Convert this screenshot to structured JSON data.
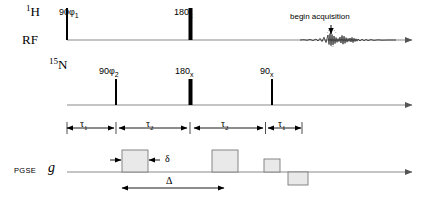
{
  "figure": {
    "type": "nmr-pulse-sequence-diagram",
    "width": 426,
    "height": 203,
    "background": "#ffffff",
    "line_color": "#808080",
    "pulse_color": "#000000",
    "gradient_fill": "#e8e8e8",
    "gradient_stroke": "#808080"
  },
  "channels": {
    "proton": {
      "label_html": "1H",
      "label": "¹H",
      "nucleus": "H",
      "mass": "1"
    },
    "rf": {
      "label": "RF"
    },
    "nitrogen": {
      "label_html": "15N",
      "label": "¹⁵N",
      "nucleus": "N",
      "mass": "15"
    },
    "pgse": {
      "label": "PGSE",
      "gradient_symbol": "g"
    }
  },
  "proton_pulses": [
    {
      "name": "excitation",
      "label": "90",
      "phase": "φ1",
      "phase_sub": "1",
      "flip_angle": 90,
      "x": 67,
      "width": 2,
      "height": 32
    },
    {
      "name": "refocusing",
      "label": "180",
      "phase": "x",
      "flip_angle": 180,
      "x": 190,
      "width": 4,
      "height": 32
    }
  ],
  "nitrogen_pulses": [
    {
      "name": "n-excitation",
      "label": "90",
      "phase": "φ2",
      "phase_sub": "2",
      "flip_angle": 90,
      "x": 116,
      "width": 2,
      "height": 26
    },
    {
      "name": "n-refocusing",
      "label": "180",
      "phase": "x",
      "flip_angle": 180,
      "x": 190,
      "width": 4,
      "height": 26
    },
    {
      "name": "n-readout",
      "label": "90",
      "phase": "x",
      "flip_angle": 90,
      "x": 272,
      "width": 2,
      "height": 26
    }
  ],
  "acquisition": {
    "label": "begin acquisition",
    "arrow": "down-arrow",
    "signal": "fid-waveform",
    "x": 328
  },
  "timings": [
    {
      "name": "tau-1-left",
      "symbol": "τ",
      "sub": "1",
      "x1": 67,
      "x2": 116
    },
    {
      "name": "tau-2-left",
      "symbol": "τ",
      "sub": "2",
      "x1": 119,
      "x2": 190
    },
    {
      "name": "tau-2-right",
      "symbol": "τ",
      "sub": "2",
      "x1": 193,
      "x2": 265
    },
    {
      "name": "tau-1-right",
      "symbol": "τ",
      "sub": "1",
      "x1": 268,
      "x2": 300
    }
  ],
  "gradient_pulses": [
    {
      "name": "gradient-1",
      "x": 122,
      "width": 26,
      "height": 22,
      "polarity": "positive"
    },
    {
      "name": "gradient-2",
      "x": 212,
      "width": 26,
      "height": 22,
      "polarity": "positive"
    },
    {
      "name": "gradient-3",
      "x": 264,
      "width": 16,
      "height": 13,
      "polarity": "positive"
    },
    {
      "name": "gradient-4",
      "x": 288,
      "width": 20,
      "height": 13,
      "polarity": "negative"
    }
  ],
  "gradient_annotations": [
    {
      "name": "delta-small",
      "symbol": "δ",
      "meaning": "gradient pulse duration",
      "x1": 122,
      "x2": 148
    },
    {
      "name": "delta-large",
      "symbol": "Δ",
      "meaning": "diffusion time",
      "x1": 122,
      "x2": 225
    }
  ],
  "baselines": {
    "rf_y": 40,
    "n15_y": 105,
    "pgse_y": 172
  }
}
